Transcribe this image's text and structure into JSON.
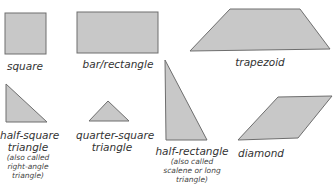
{
  "colors": {
    "fill": "#c8c8c8",
    "stroke": "#6e6e6e"
  },
  "shapes": [
    {
      "id": "square",
      "label": "square"
    },
    {
      "id": "bar-rectangle",
      "label": "bar/rectangle"
    },
    {
      "id": "trapezoid",
      "label": "trapezoid"
    },
    {
      "id": "half-square-triangle",
      "label_line1": "half-square",
      "label_line2": "triangle",
      "note_line1": "(also called",
      "note_line2": "right-angle",
      "note_line3": "triangle)"
    },
    {
      "id": "quarter-square-triangle",
      "label_line1": "quarter-square",
      "label_line2": "triangle"
    },
    {
      "id": "half-rectangle",
      "label": "half-rectangle",
      "note_line1": "(also called",
      "note_line2": "scalene or long",
      "note_line3": "triangle)"
    },
    {
      "id": "diamond",
      "label": "diamond"
    }
  ]
}
